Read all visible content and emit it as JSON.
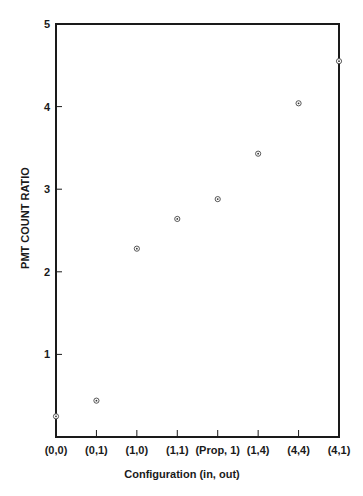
{
  "chart_data": {
    "type": "scatter",
    "title": "",
    "xlabel": "Configuration (in, out)",
    "ylabel": "PMT COUNT RATIO",
    "categories": [
      "(0,0)",
      "(0,1)",
      "(1,0)",
      "(1,1)",
      "(Prop, 1)",
      "(1,4)",
      "(4,4)",
      "(4,1)"
    ],
    "values": [
      0.25,
      0.44,
      2.28,
      2.64,
      2.88,
      3.43,
      4.04,
      4.55
    ],
    "yticks": [
      1,
      2,
      3,
      4,
      5
    ],
    "ylim": [
      0,
      5
    ],
    "grid": false,
    "legend": null,
    "marker": "circle-dot"
  },
  "colors": {
    "ink": "#1a1a1a",
    "background": "#ffffff"
  }
}
